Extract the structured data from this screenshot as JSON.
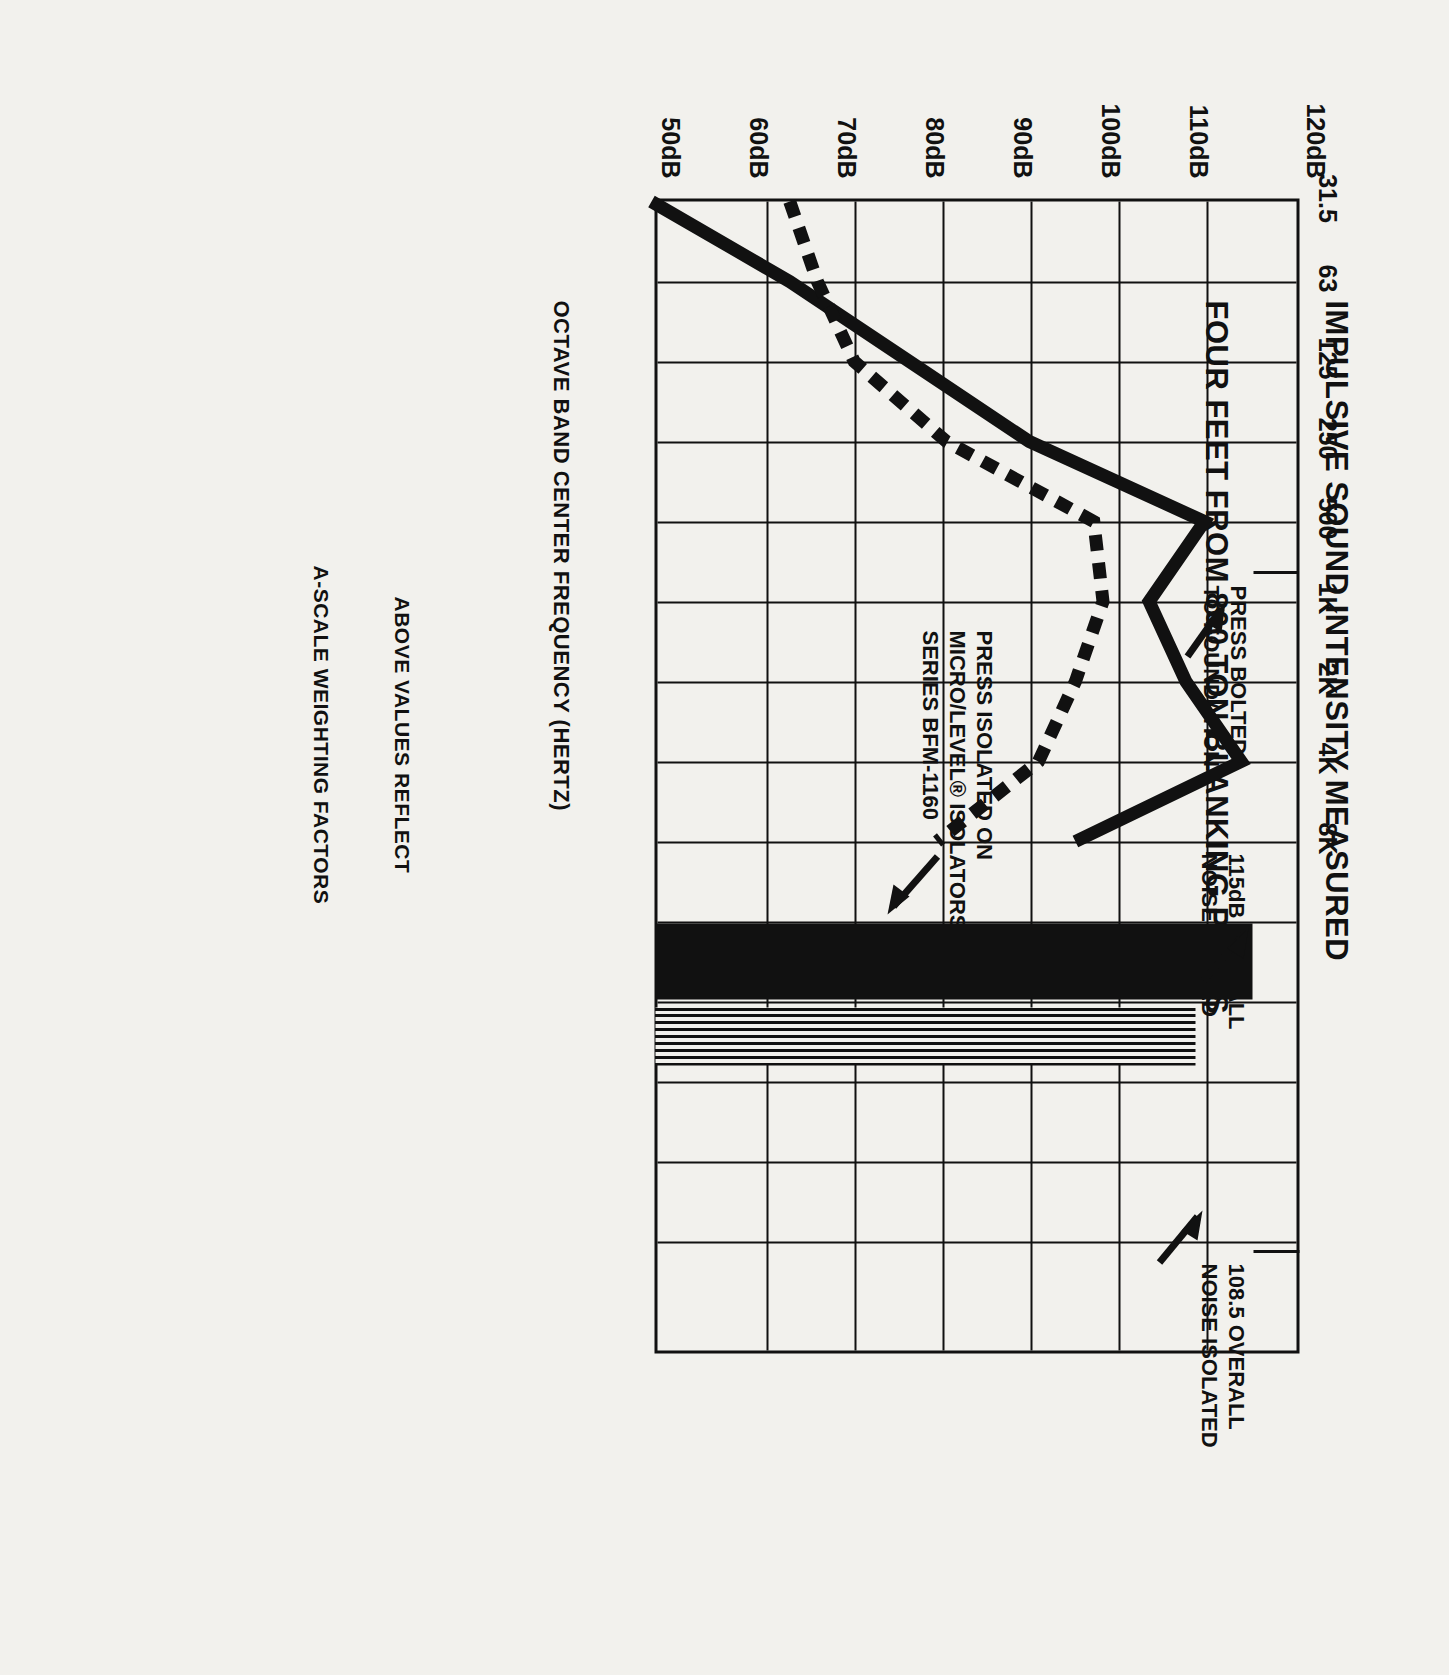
{
  "title": {
    "line1": "IMPULSIVE SOUND INTENSITY MEASURED",
    "line2": "FOUR FEET FROM 800 TON BLANKING PRESS"
  },
  "axes": {
    "y_ticks": [
      "50dB",
      "60dB",
      "70dB",
      "80dB",
      "90dB",
      "100dB",
      "110dB",
      "120dB"
    ],
    "x_ticks": [
      "31.5",
      "63",
      "125",
      "250",
      "500",
      "1K",
      "2K",
      "4K",
      "8K"
    ],
    "x_caption": "OCTAVE BAND CENTER FREQUENCY (HERTZ)"
  },
  "annotations": {
    "bolted": {
      "line1": "PRESS BOLTED",
      "line2": "TO FOUNDATION"
    },
    "isolated": {
      "line1": "PRESS ISOLATED ON",
      "line2": "MICRO/LEVEL® ISOLATORS",
      "line3": "SERIES  BFM-1160"
    },
    "overall_bolted": {
      "line1": "115dB OVERALL",
      "line2": "NOISE BOLTED"
    },
    "overall_isolated": {
      "line1": "108.5 OVERALL",
      "line2": "NOISE ISOLATED"
    }
  },
  "footnote": {
    "line1": "ABOVE VALUES REFLECT",
    "line2": "A-SCALE WEIGHTING FACTORS"
  },
  "colors": {
    "ink": "#111111",
    "paper": "#f2f1ed"
  },
  "chart_data": {
    "type": "line",
    "title": "IMPULSIVE SOUND INTENSITY MEASURED FOUR FEET FROM 800 TON BLANKING PRESS",
    "xlabel": "OCTAVE BAND CENTER FREQUENCY (HERTZ)",
    "ylabel": "Sound level (dB)",
    "categories": [
      "31.5",
      "63",
      "125",
      "250",
      "500",
      "1K",
      "2K",
      "4K",
      "8K"
    ],
    "ylim": [
      50,
      120
    ],
    "yticks": [
      50,
      60,
      70,
      80,
      90,
      100,
      110,
      120
    ],
    "grid": true,
    "legend": "annotated-inline",
    "orientation": "rotated-90-clockwise",
    "series": [
      {
        "name": "PRESS BOLTED TO FOUNDATION",
        "style": "solid",
        "overall_dB": 115,
        "values": [
          50,
          65,
          78,
          91,
          110,
          104,
          108,
          114,
          96
        ]
      },
      {
        "name": "PRESS ISOLATED ON MICRO/LEVEL® ISOLATORS SERIES BFM-1160",
        "style": "dashed",
        "overall_dB": 108.5,
        "values": [
          65,
          68,
          72,
          82,
          98,
          99,
          96,
          92,
          81
        ]
      }
    ],
    "overall_bars": [
      {
        "name": "115dB OVERALL NOISE BOLTED",
        "value": 115,
        "style": "solid"
      },
      {
        "name": "108.5 OVERALL NOISE ISOLATED",
        "value": 108.5,
        "style": "hatched"
      }
    ],
    "note": "ABOVE VALUES REFLECT A-SCALE WEIGHTING FACTORS"
  }
}
